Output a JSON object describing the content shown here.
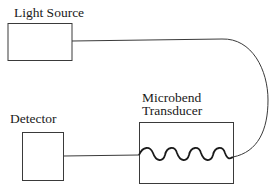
{
  "diagram": {
    "components": [
      {
        "id": "light_source",
        "label": "Light Source"
      },
      {
        "id": "detector",
        "label": "Detector"
      },
      {
        "id": "transducer",
        "label_line1": "Microbend",
        "label_line2": "Transducer"
      }
    ],
    "connections": [
      {
        "from": "light_source",
        "to": "transducer",
        "type": "optical-fiber"
      },
      {
        "from": "transducer",
        "to": "detector",
        "type": "optical-fiber"
      }
    ],
    "colors": {
      "line": "#3a3a3a",
      "background": "#ffffff"
    }
  }
}
